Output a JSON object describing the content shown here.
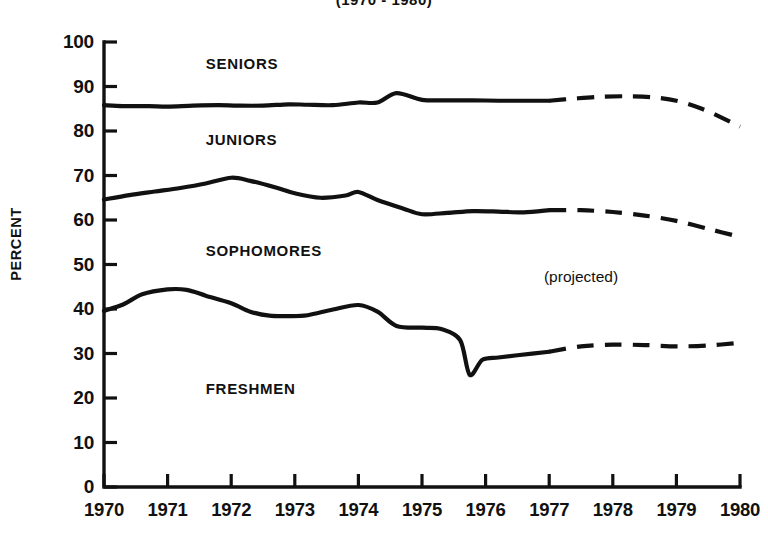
{
  "chart_data": {
    "type": "line",
    "title": "(1970 - 1980)",
    "xlabel": "",
    "ylabel": "PERCENT",
    "xlim": [
      1970,
      1980
    ],
    "ylim": [
      0,
      100
    ],
    "grid": false,
    "legend": "inline-labels",
    "x_tick_labels": [
      "1970",
      "1971",
      "1972",
      "1973",
      "1974",
      "1975",
      "1976",
      "1977",
      "1978",
      "1979",
      "1980"
    ],
    "y_tick_labels": [
      "0",
      "10",
      "20",
      "30",
      "40",
      "50",
      "60",
      "70",
      "80",
      "90",
      "100"
    ],
    "annotations": [
      {
        "text": "(projected)",
        "x": 1977.5,
        "y": 47
      }
    ],
    "series": [
      {
        "name": "SENIORS",
        "label_x": 1971.6,
        "label_y": 95,
        "solid": {
          "x": [
            1970.0,
            1970.3,
            1970.7,
            1971.0,
            1971.4,
            1971.8,
            1972.1,
            1972.5,
            1972.9,
            1973.2,
            1973.6,
            1974.0,
            1974.3,
            1974.6,
            1975.0,
            1975.4,
            1975.8,
            1976.2,
            1976.6,
            1977.0
          ],
          "y": [
            85.8,
            85.6,
            85.6,
            85.5,
            85.7,
            85.8,
            85.7,
            85.7,
            86.0,
            85.9,
            85.8,
            86.4,
            86.4,
            88.5,
            87.0,
            86.9,
            86.9,
            86.8,
            86.8,
            86.8
          ]
        },
        "dashed": {
          "x": [
            1977.0,
            1977.4,
            1977.8,
            1978.2,
            1978.6,
            1979.0,
            1979.4,
            1979.8,
            1980.0
          ],
          "y": [
            86.8,
            87.3,
            87.7,
            87.8,
            87.6,
            86.8,
            85.0,
            82.4,
            81.0
          ]
        }
      },
      {
        "name": "JUNIORS",
        "label_x": 1971.6,
        "label_y": 78,
        "solid": {
          "x": [
            1970.0,
            1970.4,
            1970.8,
            1971.2,
            1971.6,
            1972.0,
            1972.3,
            1972.7,
            1973.0,
            1973.4,
            1973.8,
            1974.0,
            1974.3,
            1974.7,
            1975.0,
            1975.4,
            1975.8,
            1976.2,
            1976.6,
            1977.0
          ],
          "y": [
            64.6,
            65.6,
            66.4,
            67.2,
            68.2,
            69.5,
            68.8,
            67.3,
            66.0,
            65.0,
            65.5,
            66.3,
            64.5,
            62.6,
            61.3,
            61.6,
            62.0,
            61.9,
            61.7,
            62.2
          ]
        },
        "dashed": {
          "x": [
            1977.0,
            1977.5,
            1978.0,
            1978.5,
            1979.0,
            1979.5,
            1980.0
          ],
          "y": [
            62.2,
            62.2,
            61.8,
            61.0,
            59.8,
            58.0,
            56.2
          ]
        }
      },
      {
        "name": "SOPHOMORES",
        "label_x": 1971.6,
        "label_y": 53,
        "solid": {
          "x": [],
          "y": []
        },
        "dashed": {
          "x": [],
          "y": []
        }
      },
      {
        "name": "FRESHMEN",
        "label_x": 1971.6,
        "label_y": 22,
        "solid": {
          "x": [
            1970.0,
            1970.3,
            1970.6,
            1971.0,
            1971.3,
            1971.6,
            1972.0,
            1972.3,
            1972.6,
            1972.9,
            1973.2,
            1973.6,
            1974.0,
            1974.3,
            1974.6,
            1975.0,
            1975.3,
            1975.6,
            1975.75,
            1975.95,
            1976.2,
            1976.5,
            1977.0
          ],
          "y": [
            39.6,
            41.0,
            43.3,
            44.4,
            44.3,
            43.0,
            41.3,
            39.4,
            38.5,
            38.4,
            38.6,
            39.9,
            40.9,
            39.4,
            36.2,
            35.8,
            35.5,
            33.0,
            25.2,
            28.6,
            29.1,
            29.6,
            30.4
          ]
        },
        "dashed": {
          "x": [
            1977.0,
            1977.5,
            1978.0,
            1978.5,
            1979.0,
            1979.5,
            1980.0
          ],
          "y": [
            30.4,
            31.6,
            32.0,
            31.9,
            31.6,
            31.8,
            32.4
          ]
        }
      }
    ]
  },
  "axes": {
    "y_axis_title": "PERCENT",
    "x_ticks": [
      "1970",
      "1971",
      "1972",
      "1973",
      "1974",
      "1975",
      "1976",
      "1977",
      "1978",
      "1979",
      "1980"
    ],
    "y_ticks": [
      "100",
      "90",
      "80",
      "70",
      "60",
      "50",
      "40",
      "30",
      "20",
      "10",
      "0"
    ]
  }
}
